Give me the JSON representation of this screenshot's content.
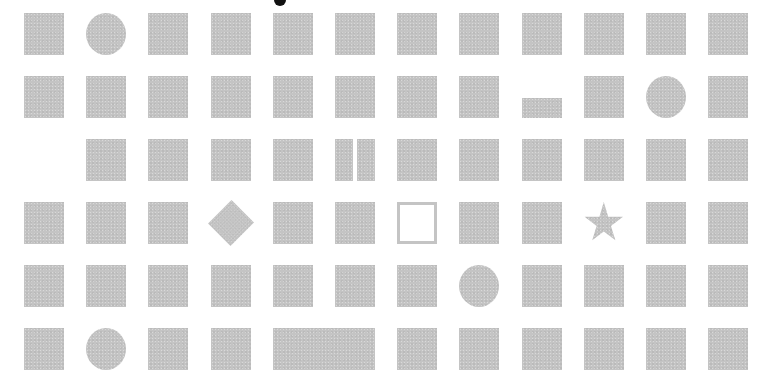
{
  "grid": {
    "columns": 12,
    "rows": 6,
    "tile_color": "#c4c4c4",
    "cells": [
      [
        "square",
        "circle",
        "square",
        "square",
        "square",
        "square",
        "square",
        "square",
        "square",
        "square",
        "square",
        "square"
      ],
      [
        "square",
        "square",
        "square",
        "square",
        "square",
        "square",
        "square",
        "square",
        "short-bar",
        "square",
        "circle",
        "square"
      ],
      [
        "empty",
        "square",
        "square",
        "square",
        "square",
        "split",
        "square",
        "square",
        "square",
        "square",
        "square",
        "square"
      ],
      [
        "square",
        "square",
        "square",
        "diamond",
        "square",
        "square",
        "outline-square",
        "square",
        "square",
        "star",
        "square",
        "square"
      ],
      [
        "square",
        "square",
        "square",
        "square",
        "square",
        "square",
        "square",
        "circle",
        "square",
        "square",
        "square",
        "square"
      ],
      [
        "square",
        "circle",
        "square",
        "square",
        "wide-bar",
        "covered",
        "square",
        "square",
        "square",
        "square",
        "square",
        "square"
      ]
    ]
  },
  "marker": {
    "shape": "dot",
    "color": "#111111"
  }
}
